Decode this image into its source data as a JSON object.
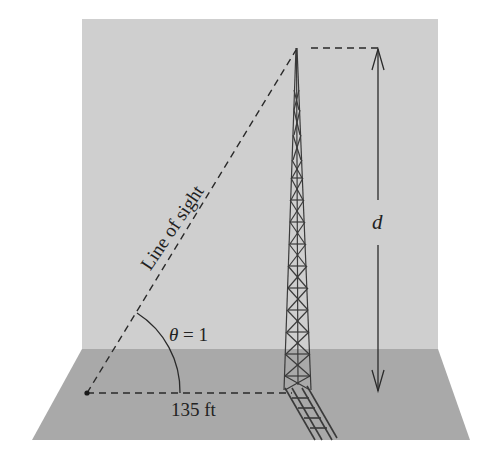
{
  "figure": {
    "type": "trigonometry-diagram"
  },
  "labels": {
    "line_of_sight": "Line of sight",
    "theta_symbol": "θ",
    "theta_eq": " = 1",
    "distance": "135 ft",
    "height": "d"
  },
  "colors": {
    "wall": "#cfcfcf",
    "floor": "#a9a9a9",
    "line": "#2a2a2a",
    "background": "#ffffff"
  },
  "values": {
    "angle_theta": 1,
    "angle_units": "radian",
    "horizontal_distance_ft": 135,
    "unknown_height": "d"
  }
}
